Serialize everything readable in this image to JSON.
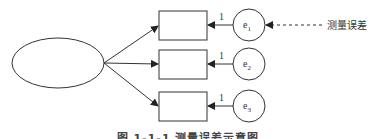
{
  "diagram": {
    "latent": {
      "label": ""
    },
    "indicators": [
      {
        "label": "",
        "loading": "1",
        "error": {
          "base": "e",
          "sub": "1"
        }
      },
      {
        "label": "",
        "loading": "1",
        "error": {
          "base": "e",
          "sub": "2"
        }
      },
      {
        "label": "",
        "loading": "1",
        "error": {
          "base": "e",
          "sub": "3"
        }
      }
    ],
    "annotation": "测量误差",
    "caption": "图 1-1-1  测量误差示意图",
    "colors": {
      "stroke": "#333333",
      "background": "#ffffff"
    }
  }
}
